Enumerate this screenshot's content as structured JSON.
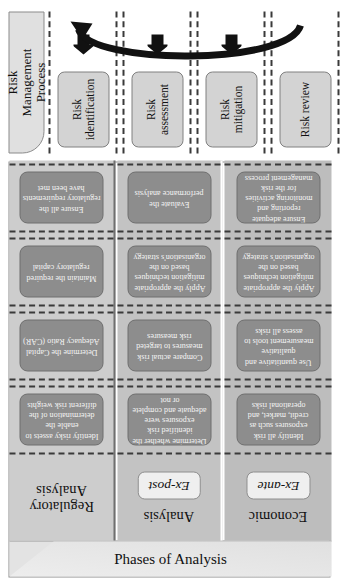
{
  "figure": {
    "spine_label": "Phases of Analysis",
    "process_header": "Risk\nManagement\nProcess"
  },
  "bands": [
    {
      "id": "regulatory",
      "title": "Regulatory\nAnalysis",
      "chip": "",
      "cells": [
        "Identify risky assets to enable the determination of the different risk weights",
        "Determine the Capital Adequacy Ratio (CAR)",
        "Maintain the required regulatory capital",
        "Ensure all the regulatory requirements have been met"
      ]
    },
    {
      "id": "ex-post",
      "title": "Analysis",
      "chip": "Ex-post",
      "cells": [
        "Determine whether the identified risk exposures were adequate and complete or not",
        "Compare actual risk measures to targeted risk measures",
        "Apply the appropriate mitigation techniques based on the organisation's strategy",
        "Evaluate the performance analysis"
      ]
    },
    {
      "id": "ex-ante",
      "title": "Economic",
      "chip": "Ex-ante",
      "cells": [
        "Identify all risk exposures such as credit, market, and operational risks",
        "Use quantitative and qualitative measurement tools to assess all risks",
        "Apply the appropriate mitigation techniques based on the organisation's strategy",
        "Ensure adequate reporting and monitoring activities for the risk management process"
      ]
    }
  ],
  "process_steps": [
    "Risk\nidentification",
    "Risk\nassessment",
    "Risk\nmitigation",
    "Risk review"
  ],
  "colors": {
    "band_regulatory": "#cdcdcd",
    "band_expost": "#c3c3c3",
    "band_exante": "#bdbdbd",
    "cell_fill": "#8d8d8d",
    "cell_text": "#f4f4f4",
    "process_fill": "#d3d3d3",
    "dashed_line": "#3a3a3a",
    "frame": "#8b8b8b"
  }
}
